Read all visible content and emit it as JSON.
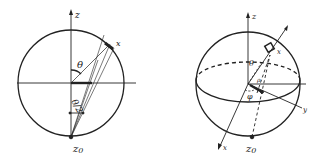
{
  "figure": {
    "left": {
      "title": "Side view of sphere with source at z0",
      "labels": {
        "z_axis": "z",
        "point": "x",
        "theta": "θ",
        "half_theta": "θ/2",
        "source": "z",
        "source_sub": "0"
      }
    },
    "right": {
      "title": "3D sphere with spherical coordinates",
      "labels": {
        "z_axis": "z",
        "x_axis": "x",
        "y_axis": "y",
        "point": "x",
        "theta": "θ",
        "rho": "ρ",
        "phi": "φ",
        "source": "z",
        "source_sub": "0"
      }
    },
    "colors": {
      "ink": "#222222",
      "background": "#ffffff"
    }
  }
}
